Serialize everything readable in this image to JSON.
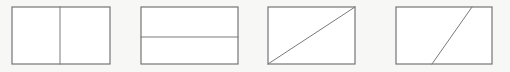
{
  "figure": {
    "background_color": "#fdfdfc",
    "outline_color": "#6f6f6f",
    "line_color": "#7a7a7a",
    "fill_color": "#ffffff",
    "panel_count": 4,
    "canvas": {
      "width": 510,
      "height": 72
    }
  },
  "panels": [
    {
      "index": 1,
      "name": "vertical-half-split",
      "description": "Rectangle split into two equal halves by a vertical line at the midpoint",
      "rect": {
        "x": 12,
        "y": 7,
        "width": 98,
        "height": 57
      },
      "divider": {
        "type": "vertical",
        "x1": 60,
        "y1": 7,
        "x2": 60,
        "y2": 64,
        "touches": "top-edge-to-bottom-edge",
        "position_fraction": 0.49
      }
    },
    {
      "index": 2,
      "name": "horizontal-split",
      "description": "Rectangle split by a horizontal line slightly below the vertical midpoint",
      "rect": {
        "x": 141,
        "y": 7,
        "width": 97,
        "height": 57
      },
      "divider": {
        "type": "horizontal",
        "x1": 141,
        "y1": 37,
        "x2": 238,
        "y2": 37,
        "touches": "left-edge-to-right-edge",
        "position_fraction": 0.53
      }
    },
    {
      "index": 3,
      "name": "corner-diagonal-split",
      "description": "Rectangle split by a diagonal from the bottom-left corner to the top-right corner",
      "rect": {
        "x": 268,
        "y": 7,
        "width": 87,
        "height": 57
      },
      "divider": {
        "type": "diagonal",
        "x1": 268,
        "y1": 64,
        "x2": 355,
        "y2": 7,
        "touches": "bottom-left-corner-to-top-right-corner",
        "position_fraction": 1.0
      }
    },
    {
      "index": 4,
      "name": "oblique-split",
      "description": "Rectangle split by an oblique line from a point on the bottom edge to a point on the top edge",
      "rect": {
        "x": 396,
        "y": 7,
        "width": 96,
        "height": 57
      },
      "divider": {
        "type": "oblique",
        "x1": 432,
        "y1": 64,
        "x2": 472,
        "y2": 7,
        "touches": "bottom-edge-to-top-edge",
        "position_fraction": 0.38
      }
    }
  ]
}
